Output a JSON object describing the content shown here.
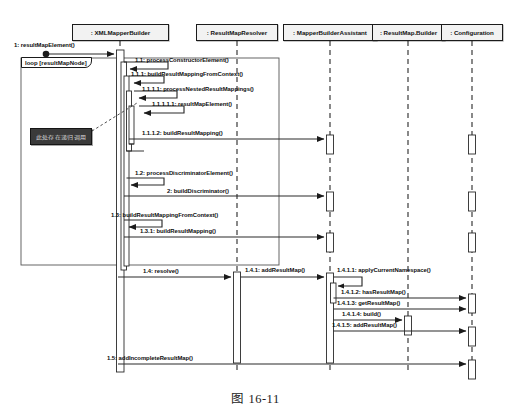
{
  "figure": {
    "caption": "图 16-11",
    "kind": "uml-sequence-diagram"
  },
  "colors": {
    "stroke": "#1b1b1b",
    "line": "#3c3c3c",
    "head_fill": "#f2f2f2",
    "activation_fill": "#ffffff",
    "note_fill": "#3a3a3a",
    "note_text": "#d8d8d8",
    "page_bg": "#ffffff"
  },
  "lifelines": [
    {
      "name": ": XMLMapperBuilder",
      "x": 120,
      "head_left": 72,
      "head_width": 97
    },
    {
      "name": ": ResultMapResolver",
      "x": 237,
      "head_left": 196,
      "head_width": 82
    },
    {
      "name": ": MapperBuilderAssistant",
      "x": 330,
      "head_left": 283,
      "head_width": 94
    },
    {
      "name": ": ResultMap.Builder",
      "x": 408,
      "head_left": 372,
      "head_width": 73
    },
    {
      "name": ": Configuration",
      "x": 472,
      "head_left": 441,
      "head_width": 62
    }
  ],
  "fragment": {
    "operator": "loop",
    "guard": "[resultMapNode]",
    "label": "loop  [resultMapNode]"
  },
  "note": {
    "text": "此处存在递归调用",
    "points_to": "1.1.1.2: buildResultMapping()"
  },
  "messages": [
    {
      "id": "1",
      "label": "1: resultMapElement()",
      "from": "actor",
      "to": ": XMLMapperBuilder",
      "kind": "found",
      "label_x": 14,
      "label_y": 42,
      "y": 54
    },
    {
      "id": "1.1",
      "label": "1.1: processConstructorElement()",
      "from": ": XMLMapperBuilder",
      "to": ": XMLMapperBuilder",
      "kind": "self",
      "label_x": 135,
      "label_y": 58,
      "y": 66
    },
    {
      "id": "1.1.1",
      "label": "1.1.1: buildResultMappingFromContext()",
      "from": ": XMLMapperBuilder",
      "to": ": XMLMapperBuilder",
      "kind": "self",
      "label_x": 131,
      "label_y": 72,
      "y": 80
    },
    {
      "id": "1.1.1.1",
      "label": "1.1.1.1: processNestedResultMappings()",
      "from": ": XMLMapperBuilder",
      "to": ": XMLMapperBuilder",
      "kind": "self",
      "label_x": 142,
      "label_y": 87,
      "y": 95
    },
    {
      "id": "1.1.1.1.1",
      "label": "1.1.1.1.1: resultMapElement()",
      "from": ": XMLMapperBuilder",
      "to": ": XMLMapperBuilder",
      "kind": "self",
      "label_x": 152,
      "label_y": 102,
      "y": 110
    },
    {
      "id": "1.1.1.2",
      "label": "1.1.1.2: buildResultMapping()",
      "from": ": XMLMapperBuilder",
      "to": ": MapperBuilderAssistant",
      "kind": "sync",
      "label_x": 142,
      "label_y": 130,
      "y": 139
    },
    {
      "id": "1.2",
      "label": "1.2: processDiscriminatorElement()",
      "from": ": XMLMapperBuilder",
      "to": ": XMLMapperBuilder",
      "kind": "self",
      "label_x": 135,
      "label_y": 170,
      "y": 178
    },
    {
      "id": "2",
      "label": "2: buildDiscriminator()",
      "from": ": XMLMapperBuilder",
      "to": ": MapperBuilderAssistant",
      "kind": "sync",
      "label_x": 167,
      "label_y": 187,
      "y": 196
    },
    {
      "id": "1.3",
      "label": "1.3: buildResultMappingFromContext()",
      "from": ": XMLMapperBuilder",
      "to": ": XMLMapperBuilder",
      "kind": "self",
      "label_x": 111,
      "label_y": 212,
      "y": 220
    },
    {
      "id": "1.3.1",
      "label": "1.3.1: buildResultMapping()",
      "from": ": XMLMapperBuilder",
      "to": ": MapperBuilderAssistant",
      "kind": "sync",
      "label_x": 140,
      "label_y": 228,
      "y": 237
    },
    {
      "id": "1.4",
      "label": "1.4: resolve()",
      "from": ": XMLMapperBuilder",
      "to": ": ResultMapResolver",
      "kind": "sync",
      "label_x": 143,
      "label_y": 268,
      "y": 277
    },
    {
      "id": "1.4.1",
      "label": "1.4.1: addResultMap()",
      "from": ": ResultMapResolver",
      "to": ": MapperBuilderAssistant",
      "kind": "sync",
      "label_x": 245,
      "label_y": 267,
      "y": 277
    },
    {
      "id": "1.4.1.1",
      "label": "1.4.1.1: applyCurrentNamespace()",
      "from": ": MapperBuilderAssistant",
      "to": ": MapperBuilderAssistant",
      "kind": "self",
      "label_x": 322,
      "label_y": 268,
      "y": 277
    },
    {
      "id": "1.4.1.2",
      "label": "1.4.1.2: hasResultMap()",
      "from": ": MapperBuilderAssistant",
      "to": ": Configuration",
      "kind": "sync",
      "label_x": 331,
      "label_y": 290,
      "y": 298
    },
    {
      "id": "1.4.1.3",
      "label": "1.4.1.3: getResultMap()",
      "from": ": MapperBuilderAssistant",
      "to": ": Configuration",
      "kind": "sync",
      "label_x": 325,
      "label_y": 301,
      "y": 309
    },
    {
      "id": "1.4.1.4",
      "label": "1.4.1.4: build()",
      "from": ": MapperBuilderAssistant",
      "to": ": ResultMap.Builder",
      "kind": "sync",
      "label_x": 333,
      "label_y": 312,
      "y": 320
    },
    {
      "id": "1.4.1.5",
      "label": "1.4.1.5: addResultMap()",
      "from": ": MapperBuilderAssistant",
      "to": ": Configuration",
      "kind": "sync",
      "label_x": 323,
      "label_y": 323,
      "y": 331
    },
    {
      "id": "1.5",
      "label": "1.5: addIncompleteResultMap()",
      "from": ": XMLMapperBuilder",
      "to": ": Configuration",
      "kind": "sync",
      "label_x": 107,
      "label_y": 355,
      "y": 364
    }
  ]
}
